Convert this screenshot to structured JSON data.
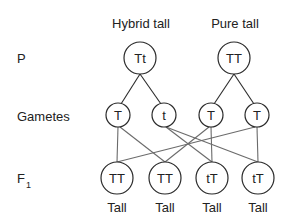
{
  "diagram": {
    "type": "monohybrid-cross",
    "colors": {
      "line": "#2a2a2a",
      "cross_line": "#6b6b6b",
      "text": "#222222",
      "background": "#ffffff"
    },
    "row_labels": {
      "parents": "P",
      "gametes": "Gametes",
      "f1_main": "F",
      "f1_sub": "1"
    },
    "parents": [
      {
        "title": "Hybrid tall",
        "genotype": "Tt"
      },
      {
        "title": "Pure tall",
        "genotype": "TT"
      }
    ],
    "gametes": [
      {
        "allele": "T",
        "from": "Hybrid tall"
      },
      {
        "allele": "t",
        "from": "Hybrid tall"
      },
      {
        "allele": "T",
        "from": "Pure tall"
      },
      {
        "allele": "T",
        "from": "Pure tall"
      }
    ],
    "f1": [
      {
        "genotype": "TT",
        "phenotype": "Tall"
      },
      {
        "genotype": "TT",
        "phenotype": "Tall"
      },
      {
        "genotype": "tT",
        "phenotype": "Tall"
      },
      {
        "genotype": "tT",
        "phenotype": "Tall"
      }
    ],
    "crosses": [
      {
        "gamete": 0,
        "offspring": 0
      },
      {
        "gamete": 0,
        "offspring": 1
      },
      {
        "gamete": 1,
        "offspring": 2
      },
      {
        "gamete": 1,
        "offspring": 3
      },
      {
        "gamete": 2,
        "offspring": 2
      },
      {
        "gamete": 2,
        "offspring": 1
      },
      {
        "gamete": 3,
        "offspring": 3
      },
      {
        "gamete": 3,
        "offspring": 0
      }
    ]
  }
}
